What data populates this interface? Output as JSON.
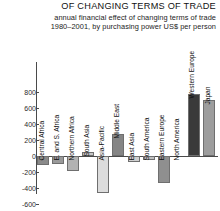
{
  "header": {
    "title": "OF CHANGING TERMS OF TRADE",
    "subtitle_line1": "annual financial effect of changing terms of trade",
    "subtitle_line2": "1980–2001, by purchasing power US$ per person",
    "stray_glyph": "2"
  },
  "chart_data": {
    "type": "bar",
    "title": "OF CHANGING TERMS OF TRADE",
    "subtitle": "annual financial effect of changing terms of trade 1980–2001, by purchasing power US$ per person",
    "xlabel": "",
    "ylabel": "",
    "ylim": [
      -600,
      800
    ],
    "yticks": [
      800,
      600,
      400,
      200,
      0,
      -200,
      -400,
      -600
    ],
    "ytick_labels": [
      "800",
      "600",
      "400",
      "200",
      "0",
      "-200",
      "-400",
      "-600"
    ],
    "grid": false,
    "legend": "none",
    "units": "purchasing power US$ per person per year",
    "categories": [
      "Central Africa",
      "E. and S. Africa",
      "Northern Africa",
      "South Asia",
      "Asia-Pacific",
      "Middle East",
      "East Asia",
      "South America",
      "Eastern Europe",
      "North America",
      "Western Europe",
      "Japan"
    ],
    "values": [
      -110,
      -95,
      -185,
      50,
      -460,
      270,
      -75,
      -50,
      -340,
      0,
      770,
      700
    ],
    "colors": [
      "#8a8a8a",
      "#9a9a9a",
      "#b2b2b2",
      "#c6c6c6",
      "#dcdcdc",
      "#858585",
      "#cfcfcf",
      "#c0c0c0",
      "#8f8f8f",
      "#e8e8e8",
      "#3a3a3a",
      "#9d9d9d"
    ]
  }
}
